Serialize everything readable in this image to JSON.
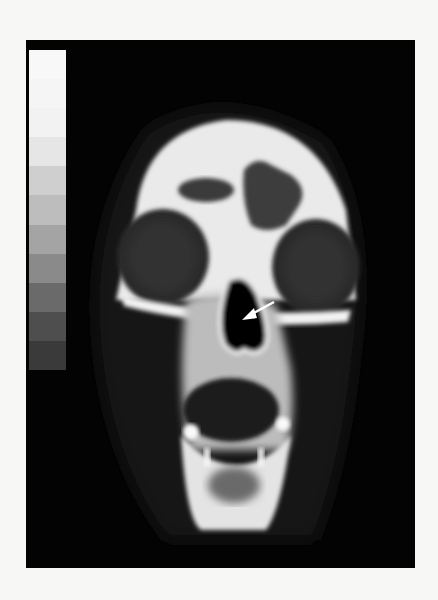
{
  "image": {
    "description": "Coronal CT scan of an animal skull with grayscale calibration bar and white arrow pointing into nasal cavity",
    "background": "#f7f7f5",
    "panel_color": "#030303"
  },
  "grayscale_bar": {
    "steps": [
      "#f8f8f8",
      "#f5f5f5",
      "#f2f2f2",
      "#e6e6e6",
      "#cfcfcf",
      "#bdbdbd",
      "#a4a4a4",
      "#8a8a8a",
      "#6a6a6a",
      "#4e4e4e",
      "#3a3a3a"
    ]
  },
  "annotation": {
    "arrow_color": "#ffffff",
    "arrow_target": "nasal-cavity"
  }
}
